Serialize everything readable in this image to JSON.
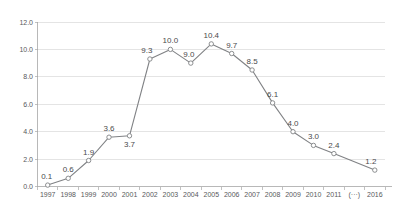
{
  "chart_data": {
    "type": "line",
    "title": "",
    "subtitle": "",
    "xlabel": "",
    "ylabel": "",
    "categories": [
      "1997",
      "1998",
      "1999",
      "2000",
      "2001",
      "2002",
      "2003",
      "2004",
      "2005",
      "2006",
      "2007",
      "2008",
      "2009",
      "2010",
      "2011",
      "(···)",
      "2016"
    ],
    "values": [
      0.1,
      0.6,
      1.9,
      3.6,
      3.7,
      9.3,
      10.0,
      9.0,
      10.4,
      9.7,
      8.5,
      6.1,
      4.0,
      3.0,
      2.4,
      null,
      1.2
    ],
    "point_labels": [
      "0.1",
      "0.6",
      "1.9",
      "3.6",
      "3.7",
      "9.3",
      "10.0",
      "9.0",
      "10.4",
      "9.7",
      "8.5",
      "6.1",
      "4.0",
      "3.0",
      "2.4",
      "",
      "1.2"
    ],
    "label_positions": [
      "above",
      "above",
      "above",
      "above",
      "below",
      "above",
      "above",
      "above",
      "above",
      "above",
      "above",
      "above",
      "above",
      "above",
      "above",
      "none",
      "above"
    ],
    "ylim": [
      0.0,
      12.0
    ],
    "ytick_values": [
      0.0,
      2.0,
      4.0,
      6.0,
      8.0,
      10.0,
      12.0
    ],
    "ytick_labels": [
      "0.0",
      "2.0",
      "4.0",
      "6.0",
      "8.0",
      "10.0",
      "12.0"
    ],
    "grid": true,
    "grid_axis": "y",
    "legend": false,
    "legend_position": "none",
    "series": [
      {
        "name": "series-1",
        "values": [
          0.1,
          0.6,
          1.9,
          3.6,
          3.7,
          9.3,
          10.0,
          9.0,
          10.4,
          9.7,
          8.5,
          6.1,
          4.0,
          3.0,
          2.4,
          null,
          1.2
        ],
        "line_color": "#808285",
        "marker": "open-circle",
        "marker_fill": "#ffffff"
      }
    ],
    "gap_category": "(···)",
    "colors": {
      "line": "#808285",
      "marker_stroke": "#808285",
      "marker_fill": "#ffffff",
      "gridline": "#d9d9d9",
      "axis": "#a6a6a6",
      "tick_text": "#58595b",
      "value_text": "#4a4a4c",
      "background": "#ffffff"
    }
  }
}
